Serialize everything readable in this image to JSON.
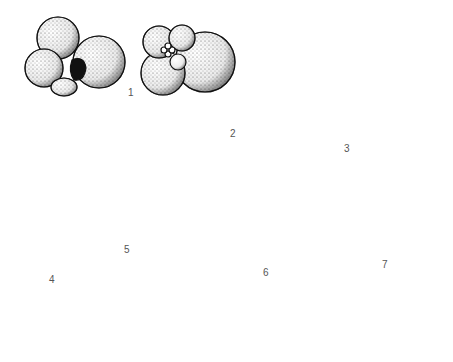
{
  "figure": {
    "background": "#ffffff",
    "ink": "#1a1a1a",
    "specimens": [
      {
        "id": 1,
        "label": "1",
        "views": 2,
        "shape": "globular trochospiral, stippled chambers"
      },
      {
        "id": 2,
        "label": "2",
        "views": 1,
        "shape": "flask / pear shaped unilocular"
      },
      {
        "id": 3,
        "label": "3",
        "views": 1,
        "shape": "planispiral with curved septa"
      },
      {
        "id": 4,
        "label": "4",
        "views": 1,
        "shape": "uniserial elongate chain of chambers"
      },
      {
        "id": 5,
        "label": "5",
        "views": 2,
        "shape": "trochospiral spiral and umbilical views"
      },
      {
        "id": 6,
        "label": "6",
        "views": 1,
        "shape": "biserial tapering, stippled"
      },
      {
        "id": 7,
        "label": "7",
        "views": 2,
        "shape": "small globular with slit aperture; miliolid oval"
      }
    ]
  }
}
